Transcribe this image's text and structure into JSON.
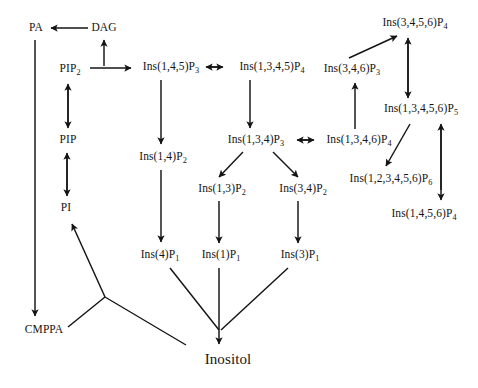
{
  "diagram": {
    "stroke_color": "#141414",
    "background_color": "#ffffff",
    "nodes": [
      {
        "id": "pa",
        "label": "PA",
        "sub": "",
        "x": 36,
        "y": 28,
        "terminal": false
      },
      {
        "id": "dag",
        "label": "DAG",
        "sub": "",
        "x": 104,
        "y": 28,
        "terminal": false
      },
      {
        "id": "pip2",
        "label": "PIP",
        "sub": "2",
        "x": 70,
        "y": 70,
        "terminal": false
      },
      {
        "id": "pip",
        "label": "PIP",
        "sub": "",
        "x": 68,
        "y": 140,
        "terminal": false
      },
      {
        "id": "pi",
        "label": "PI",
        "sub": "",
        "x": 66,
        "y": 208,
        "terminal": false
      },
      {
        "id": "cmppa",
        "label": "CMPPA",
        "sub": "",
        "x": 44,
        "y": 330,
        "terminal": false
      },
      {
        "id": "ins145p3",
        "label": "Ins(1,4,5)P",
        "sub": "3",
        "x": 171,
        "y": 68,
        "terminal": false
      },
      {
        "id": "ins14p2",
        "label": "Ins(1,4)P",
        "sub": "2",
        "x": 163,
        "y": 158,
        "terminal": false
      },
      {
        "id": "ins4p1",
        "label": "Ins(4)P",
        "sub": "1",
        "x": 160,
        "y": 256,
        "terminal": false
      },
      {
        "id": "ins1345p4",
        "label": "Ins(1,3,4,5)P",
        "sub": "4",
        "x": 272,
        "y": 68,
        "terminal": false
      },
      {
        "id": "ins134p3",
        "label": "Ins(1,3,4)P",
        "sub": "3",
        "x": 256,
        "y": 141,
        "terminal": false
      },
      {
        "id": "ins13p2",
        "label": "Ins(1,3)P",
        "sub": "2",
        "x": 222,
        "y": 190,
        "terminal": false
      },
      {
        "id": "ins34p2",
        "label": "Ins(3,4)P",
        "sub": "2",
        "x": 303,
        "y": 190,
        "terminal": false
      },
      {
        "id": "ins1p1",
        "label": "Ins(1)P",
        "sub": "1",
        "x": 221,
        "y": 256,
        "terminal": false
      },
      {
        "id": "ins3p1",
        "label": "Ins(3)P",
        "sub": "1",
        "x": 300,
        "y": 256,
        "terminal": false
      },
      {
        "id": "ins1346p4",
        "label": "Ins(1,3,4,6)P",
        "sub": "4",
        "x": 359,
        "y": 141,
        "terminal": false
      },
      {
        "id": "ins346p3",
        "label": "Ins(3,4,6)P",
        "sub": "3",
        "x": 352,
        "y": 70,
        "terminal": false
      },
      {
        "id": "ins3456p4",
        "label": "Ins(3,4,5,6)P",
        "sub": "4",
        "x": 415,
        "y": 24,
        "terminal": false
      },
      {
        "id": "ins13456p5",
        "label": "Ins(1,3,4,5,6)P",
        "sub": "5",
        "x": 421,
        "y": 110,
        "terminal": false
      },
      {
        "id": "ins123456p6",
        "label": "Ins(1,2,3,4,5,6)P",
        "sub": "6",
        "x": 391,
        "y": 180,
        "terminal": false
      },
      {
        "id": "ins1456p4",
        "label": "Ins(1,4,5,6)P",
        "sub": "4",
        "x": 424,
        "y": 215,
        "terminal": false
      },
      {
        "id": "inositol",
        "label": "Inositol",
        "sub": "",
        "x": 228,
        "y": 359,
        "terminal": true
      }
    ],
    "edges": [
      {
        "id": "dag-to-pa",
        "from": "dag",
        "to": "pa",
        "type": "arrow"
      },
      {
        "id": "pip2-to-dag",
        "from": "pip2",
        "to": "dag",
        "type": "arrow"
      },
      {
        "id": "pip2-to-ins145p3",
        "from": "pip2",
        "to": "ins145p3",
        "type": "arrow"
      },
      {
        "id": "pip2-pip",
        "from": "pip2",
        "to": "pip",
        "type": "double-arrow"
      },
      {
        "id": "pip-pi",
        "from": "pip",
        "to": "pi",
        "type": "double-arrow"
      },
      {
        "id": "pa-to-cmppa",
        "from": "pa",
        "to": "cmppa",
        "type": "arrow"
      },
      {
        "id": "ins145p3-to-ins14p2",
        "from": "ins145p3",
        "to": "ins14p2",
        "type": "arrow"
      },
      {
        "id": "ins14p2-to-ins4p1",
        "from": "ins14p2",
        "to": "ins4p1",
        "type": "arrow"
      },
      {
        "id": "ins145p3-ins1345p4",
        "from": "ins145p3",
        "to": "ins1345p4",
        "type": "double-arrow"
      },
      {
        "id": "ins1345p4-to-ins134p3",
        "from": "ins1345p4",
        "to": "ins134p3",
        "type": "arrow"
      },
      {
        "id": "ins134p3-to-ins13p2",
        "from": "ins134p3",
        "to": "ins13p2",
        "type": "arrow"
      },
      {
        "id": "ins134p3-to-ins34p2",
        "from": "ins134p3",
        "to": "ins34p2",
        "type": "arrow"
      },
      {
        "id": "ins13p2-to-ins1p1",
        "from": "ins13p2",
        "to": "ins1p1",
        "type": "arrow"
      },
      {
        "id": "ins34p2-to-ins3p1",
        "from": "ins34p2",
        "to": "ins3p1",
        "type": "arrow"
      },
      {
        "id": "ins134p3-ins1346p4",
        "from": "ins134p3",
        "to": "ins1346p4",
        "type": "double-arrow"
      },
      {
        "id": "ins1346p4-to-ins346p3",
        "from": "ins1346p4",
        "to": "ins346p3",
        "type": "arrow"
      },
      {
        "id": "ins346p3-to-ins3456p4",
        "from": "ins346p3",
        "to": "ins3456p4",
        "type": "arrow"
      },
      {
        "id": "ins3456p4-ins13456p5",
        "from": "ins3456p4",
        "to": "ins13456p5",
        "type": "double-arrow"
      },
      {
        "id": "ins13456p5-to-ins123456p6",
        "from": "ins13456p5",
        "to": "ins123456p6",
        "type": "arrow"
      },
      {
        "id": "ins13456p5-ins1456p4",
        "from": "ins13456p5",
        "to": "ins1456p4",
        "type": "double-arrow"
      },
      {
        "id": "ins4p1-to-inositol",
        "from": "ins4p1",
        "to": "inositol",
        "type": "line"
      },
      {
        "id": "ins1p1-to-inositol",
        "from": "ins1p1",
        "to": "inositol",
        "type": "arrow"
      },
      {
        "id": "ins3p1-to-inositol",
        "from": "ins3p1",
        "to": "inositol",
        "type": "line"
      },
      {
        "id": "inositol-to-pi",
        "from": "inositol",
        "to": "pi",
        "type": "arrow"
      },
      {
        "id": "cmppa-junction",
        "from": "cmppa",
        "to": "inositol",
        "type": "line"
      }
    ]
  }
}
